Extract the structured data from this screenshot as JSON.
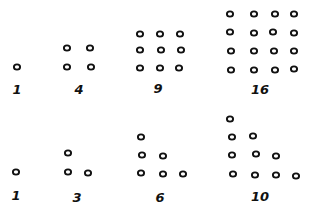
{
  "title": "",
  "style": {
    "ink": "#111111",
    "background": "#ffffff",
    "dot_radius": 3.1
  },
  "rows": [
    {
      "name": "square-numbers",
      "figures": [
        {
          "label": "1",
          "label_pos": [
            17,
            89
          ],
          "dots": [
            [
              17,
              67
            ]
          ]
        },
        {
          "label": "4",
          "label_pos": [
            79,
            89
          ],
          "dots": [
            [
              67,
              48
            ],
            [
              90,
              48
            ],
            [
              67,
              67
            ],
            [
              91,
              67
            ]
          ]
        },
        {
          "label": "9",
          "label_pos": [
            158,
            88
          ],
          "dots": [
            [
              140,
              34
            ],
            [
              160,
              34
            ],
            [
              180,
              34
            ],
            [
              140,
              50
            ],
            [
              161,
              50
            ],
            [
              181,
              50
            ],
            [
              140,
              68
            ],
            [
              160,
              68
            ],
            [
              179,
              68
            ]
          ]
        },
        {
          "label": "16",
          "label_pos": [
            260,
            89
          ],
          "dots": [
            [
              230,
              14
            ],
            [
              254,
              14
            ],
            [
              275,
              14
            ],
            [
              294,
              14
            ],
            [
              230,
              32
            ],
            [
              254,
              33
            ],
            [
              273,
              32
            ],
            [
              294,
              33
            ],
            [
              231,
              51
            ],
            [
              254,
              51
            ],
            [
              274,
              51
            ],
            [
              294,
              51
            ],
            [
              231,
              70
            ],
            [
              254,
              70
            ],
            [
              275,
              70
            ],
            [
              294,
              69
            ]
          ]
        }
      ]
    },
    {
      "name": "triangular-numbers",
      "figures": [
        {
          "label": "1",
          "label_pos": [
            16,
            195
          ],
          "dots": [
            [
              16,
              172
            ]
          ]
        },
        {
          "label": "3",
          "label_pos": [
            77,
            197
          ],
          "dots": [
            [
              68,
              153
            ],
            [
              68,
              172
            ],
            [
              88,
              173
            ]
          ]
        },
        {
          "label": "6",
          "label_pos": [
            160,
            197
          ],
          "dots": [
            [
              141,
              137
            ],
            [
              142,
              155
            ],
            [
              163,
              156
            ],
            [
              141,
              173
            ],
            [
              163,
              174
            ],
            [
              183,
              174
            ]
          ]
        },
        {
          "label": "10",
          "label_pos": [
            260,
            196
          ],
          "dots": [
            [
              230,
              119
            ],
            [
              232,
              137
            ],
            [
              253,
              136
            ],
            [
              232,
              155
            ],
            [
              256,
              154
            ],
            [
              276,
              156
            ],
            [
              233,
              174
            ],
            [
              255,
              175
            ],
            [
              276,
              175
            ],
            [
              296,
              176
            ]
          ]
        }
      ]
    }
  ]
}
